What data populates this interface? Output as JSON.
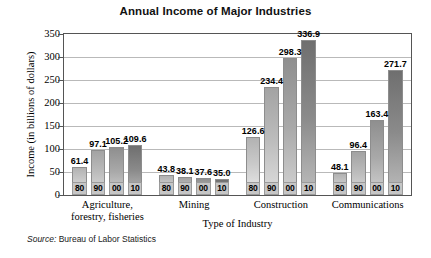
{
  "chart_data": {
    "type": "bar",
    "title": "Annual Income of Major Industries",
    "xlabel": "Type of Industry",
    "ylabel": "Income (in billions of dollars)",
    "ylim": [
      0,
      350
    ],
    "ytick_step": 50,
    "yticks": [
      0,
      50,
      100,
      150,
      200,
      250,
      300,
      350
    ],
    "grid": true,
    "legend": "none",
    "source": "Source: Bureau of Labor Statistics",
    "source_prefix": "Source:",
    "source_body": "Bureau of Labor Statistics",
    "series_labels": [
      "80",
      "90",
      "00",
      "10"
    ],
    "categories": [
      "Agriculture, forestry, fisheries",
      "Mining",
      "Construction",
      "Communications"
    ],
    "groups": [
      {
        "name": "Agriculture, forestry, fisheries",
        "label_line1": "Agriculture,",
        "label_line2": "forestry, fisheries",
        "bars": [
          {
            "year": "80",
            "value": 61.4
          },
          {
            "year": "90",
            "value": 97.1
          },
          {
            "year": "00",
            "value": 105.2
          },
          {
            "year": "10",
            "value": 109.6
          }
        ]
      },
      {
        "name": "Mining",
        "label_line1": "Mining",
        "label_line2": "",
        "bars": [
          {
            "year": "80",
            "value": 43.8
          },
          {
            "year": "90",
            "value": 38.1
          },
          {
            "year": "00",
            "value": 37.6
          },
          {
            "year": "10",
            "value": 35.0
          }
        ]
      },
      {
        "name": "Construction",
        "label_line1": "Construction",
        "label_line2": "",
        "bars": [
          {
            "year": "80",
            "value": 126.6
          },
          {
            "year": "90",
            "value": 234.4
          },
          {
            "year": "00",
            "value": 298.3
          },
          {
            "year": "10",
            "value": 336.9
          }
        ]
      },
      {
        "name": "Communications",
        "label_line1": "Communications",
        "label_line2": "",
        "bars": [
          {
            "year": "80",
            "value": 48.1
          },
          {
            "year": "90",
            "value": 96.4
          },
          {
            "year": "00",
            "value": 163.4
          },
          {
            "year": "10",
            "value": 271.7
          }
        ]
      }
    ],
    "value_labels": [
      "61.4",
      "97.1",
      "105.2",
      "109.6",
      "43.8",
      "38.1",
      "37.6",
      "35.0",
      "126.6",
      "234.4",
      "298.3",
      "336.9",
      "48.1",
      "96.4",
      "163.4",
      "271.7"
    ],
    "colors": {
      "frame": "#555555",
      "gridline": "#b9b9b9",
      "bar_80": "#c9c9c9",
      "bar_90": "#bdbdbd",
      "bar_00": "#a9a9a9",
      "bar_10": "#8b8b8b",
      "year_box": "#c6c6c6",
      "background": "#ffffff",
      "text": "#000000"
    }
  }
}
